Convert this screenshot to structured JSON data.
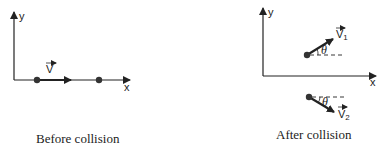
{
  "before": {
    "caption": "Before collision",
    "axis_x": "x",
    "axis_y": "y",
    "velocity_label": "V"
  },
  "after": {
    "caption": "After collision",
    "axis_x": "x",
    "axis_y": "y",
    "velocity1_label": "V",
    "velocity1_sub": "1",
    "velocity2_label": "V",
    "velocity2_sub": "2",
    "angle1": "θ",
    "angle2": "θ"
  },
  "colors": {
    "ink": "#222222",
    "background": "#ffffff"
  }
}
